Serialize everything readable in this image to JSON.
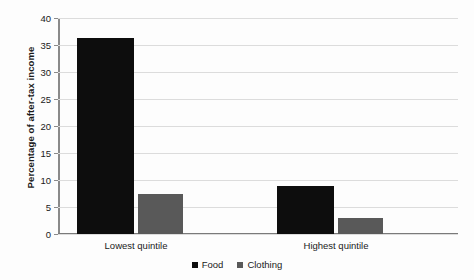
{
  "chart_data": {
    "type": "bar",
    "title": "",
    "subtitle": "",
    "xlabel": "",
    "ylabel": "Percentage of after-tax income",
    "categories": [
      "Lowest quintile",
      "Highest quintile"
    ],
    "series": [
      {
        "name": "Food",
        "color": "#0d0d0d",
        "values": [
          36.3,
          8.8
        ]
      },
      {
        "name": "Clothing",
        "color": "#595959",
        "values": [
          7.4,
          3.0
        ]
      }
    ],
    "ylim": [
      0,
      40
    ],
    "yticks": [
      0,
      5,
      10,
      15,
      20,
      25,
      30,
      35,
      40
    ],
    "ytick_labels": [
      "0",
      "5",
      "10",
      "15",
      "20",
      "25",
      "30",
      "35",
      "40"
    ],
    "grid": true,
    "grid_axis": "y",
    "legend_position": "bottom",
    "legend_entries": [
      "Food",
      "Clothing"
    ],
    "annotations": []
  },
  "colors": {
    "background": "#fdfdfd",
    "gridline": "#dcdcdc",
    "axis": "#8a8a8a",
    "text": "#1a1a1a",
    "food": "#0d0d0d",
    "clothing": "#595959"
  }
}
